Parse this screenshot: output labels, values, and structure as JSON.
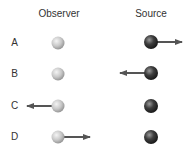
{
  "headers": {
    "observer": "Observer",
    "source": "Source"
  },
  "colors": {
    "observer_ball": "#c4c4c4",
    "source_ball": "#3a3a3a",
    "arrow": "#555555",
    "text": "#333333"
  },
  "rows": [
    {
      "label": "A",
      "moving": "source",
      "direction": "right"
    },
    {
      "label": "B",
      "moving": "source",
      "direction": "left"
    },
    {
      "label": "C",
      "moving": "observer",
      "direction": "left"
    },
    {
      "label": "D",
      "moving": "observer",
      "direction": "right"
    }
  ]
}
